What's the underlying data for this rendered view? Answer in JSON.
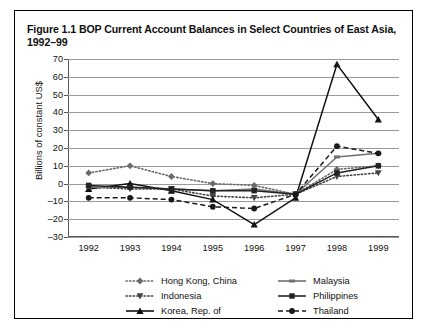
{
  "figure": {
    "title": "Figure 1.1 BOP Current Account Balances in Select Countries of East Asia, 1992–99"
  },
  "chart_data": {
    "type": "line",
    "title": "Figure 1.1 BOP Current Account Balances in Select Countries of East Asia, 1992–99",
    "xlabel": "",
    "ylabel": "Billions of constant US$",
    "x": [
      "1992",
      "1993",
      "1994",
      "1995",
      "1996",
      "1997",
      "1998",
      "1999"
    ],
    "categories": [
      "1992",
      "1993",
      "1994",
      "1995",
      "1996",
      "1997",
      "1998",
      "1999"
    ],
    "ylim": [
      -30,
      70
    ],
    "yticks": [
      -30,
      -20,
      -10,
      0,
      10,
      20,
      30,
      40,
      50,
      60,
      70
    ],
    "ytick_labels": [
      "–30",
      "–20",
      "–10",
      "0",
      "10",
      "20",
      "30",
      "40",
      "50",
      "60",
      "70"
    ],
    "grid": true,
    "legend_position": "below",
    "series": [
      {
        "name": "Hong Kong, China",
        "values": [
          6,
          10,
          4,
          0,
          -1,
          -6,
          8,
          10
        ],
        "line_style": "dotted",
        "marker": "diamond",
        "color": "#6b6b6b"
      },
      {
        "name": "Indonesia",
        "values": [
          -2,
          -3,
          -3,
          -7,
          -8,
          -6,
          4,
          6
        ],
        "line_style": "dotted",
        "marker": "triangle-down",
        "color": "#444444"
      },
      {
        "name": "Korea, Rep. of",
        "values": [
          -3,
          0,
          -4,
          -9,
          -23,
          -8,
          67,
          36
        ],
        "line_style": "solid",
        "marker": "triangle-up",
        "color": "#111111"
      },
      {
        "name": "Malaysia",
        "values": [
          -2,
          -2,
          -3,
          -4,
          -3,
          -6,
          15,
          17
        ],
        "line_style": "solid",
        "marker": "dash",
        "color": "#707070"
      },
      {
        "name": "Philippines",
        "values": [
          -1,
          -2,
          -3,
          -4,
          -4,
          -6,
          6,
          10
        ],
        "line_style": "solid",
        "marker": "square",
        "color": "#222222"
      },
      {
        "name": "Thailand",
        "values": [
          -8,
          -8,
          -9,
          -13,
          -14,
          -6,
          21,
          17
        ],
        "line_style": "dashed",
        "marker": "circle",
        "color": "#1a1a1a"
      }
    ]
  },
  "legend": {
    "left": [
      "Hong Kong, China",
      "Indonesia",
      "Korea, Rep. of"
    ],
    "right": [
      "Malaysia",
      "Philippines",
      "Thailand"
    ]
  }
}
